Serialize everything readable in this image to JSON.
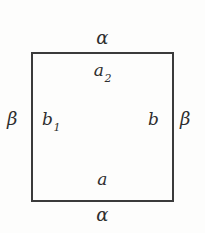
{
  "figure": {
    "type": "labeled-square-diagram",
    "background_color": "#fdfdfc",
    "stroke_color": "#3b3b3b",
    "text_color": "#2e2e2e"
  },
  "shape": {
    "name": "square",
    "x": 31,
    "y": 52,
    "width": 143,
    "height": 150,
    "stroke_width": 2
  },
  "labels": {
    "top_outside": "α",
    "top_inside_base": "a",
    "top_inside_sub": "2",
    "left_outside": "β",
    "left_inside_base": "b",
    "left_inside_sub": "1",
    "right_inside": "b",
    "right_outside": "β",
    "bottom_inside": "a",
    "bottom_outside": "α"
  }
}
